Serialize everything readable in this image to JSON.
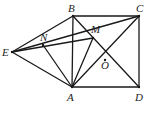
{
  "diagram": {
    "type": "geometry",
    "points": {
      "A": {
        "x": 72,
        "y": 87,
        "label": "A",
        "lx": 67,
        "ly": 101
      },
      "B": {
        "x": 73,
        "y": 16,
        "label": "B",
        "lx": 68,
        "ly": 12
      },
      "C": {
        "x": 139,
        "y": 16,
        "label": "C",
        "lx": 136,
        "ly": 12
      },
      "D": {
        "x": 139,
        "y": 87,
        "label": "D",
        "lx": 135,
        "ly": 101
      },
      "E": {
        "x": 12,
        "y": 52,
        "label": "E",
        "lx": 2,
        "ly": 56
      },
      "N": {
        "x": 43,
        "y": 45,
        "label": "N",
        "lx": 40,
        "ly": 41
      },
      "M": {
        "x": 93,
        "y": 38,
        "label": "M",
        "lx": 91,
        "ly": 33
      },
      "O": {
        "x": 105,
        "y": 60,
        "label": "O",
        "lx": 101,
        "ly": 69
      }
    },
    "segments": [
      [
        "A",
        "B"
      ],
      [
        "B",
        "C"
      ],
      [
        "C",
        "D"
      ],
      [
        "D",
        "A"
      ],
      [
        "B",
        "D"
      ],
      [
        "A",
        "C"
      ],
      [
        "E",
        "B"
      ],
      [
        "E",
        "A"
      ],
      [
        "E",
        "C"
      ],
      [
        "N",
        "A"
      ],
      [
        "M",
        "A"
      ],
      [
        "E",
        "M"
      ]
    ]
  }
}
